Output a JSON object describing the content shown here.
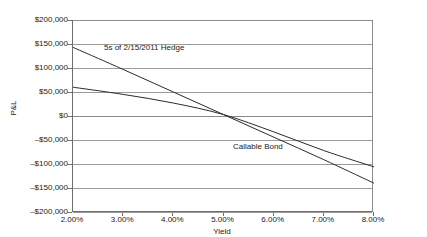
{
  "chart_data": {
    "type": "line",
    "title": "",
    "xlabel": "Yield",
    "ylabel": "P&L",
    "xlim": [
      0.02,
      0.08
    ],
    "ylim": [
      -200000,
      200000
    ],
    "grid": true,
    "legend_position": "inline-annotation",
    "x_tick_labels": [
      "2.00%",
      "3.00%",
      "4.00%",
      "5.00%",
      "6.00%",
      "7.00%",
      "8.00%"
    ],
    "x_tick_values": [
      0.02,
      0.03,
      0.04,
      0.05,
      0.06,
      0.07,
      0.08
    ],
    "y_tick_labels": [
      "$200,000",
      "$150,000",
      "$100,000",
      "$50,000",
      "$0",
      "–$50,000",
      "–$100,000",
      "–$150,000",
      "–$200,000"
    ],
    "y_tick_values": [
      200000,
      150000,
      100000,
      50000,
      0,
      -50000,
      -100000,
      -150000,
      -200000
    ],
    "x": [
      0.02,
      0.03,
      0.04,
      0.05,
      0.06,
      0.07,
      0.08
    ],
    "series": [
      {
        "name": "5s of 2/15/2011 Hedge",
        "values": [
          143000,
          97000,
          50000,
          3000,
          -44000,
          -91000,
          -140000
        ]
      },
      {
        "name": "Callable Bond",
        "values": [
          60000,
          45000,
          27000,
          3000,
          -33000,
          -72000,
          -106000
        ]
      }
    ]
  },
  "annotations": {
    "hedge_label": "5s of 2/15/2011 Hedge",
    "callable_label": "Callable Bond"
  },
  "axes": {
    "y_title": "P&L",
    "x_title": "Yield"
  }
}
